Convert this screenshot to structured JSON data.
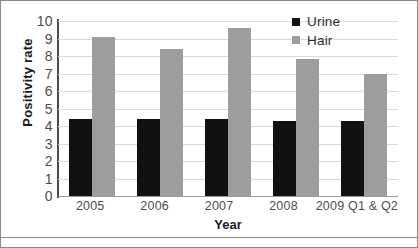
{
  "chart_data": {
    "type": "bar",
    "title": "",
    "subtitle": "",
    "xlabel": "Year",
    "ylabel": "Positivity rate",
    "categories": [
      "2005",
      "2006",
      "2007",
      "2008",
      "2009 Q1 & Q2"
    ],
    "series": [
      {
        "name": "Urine",
        "color": "#111111",
        "values": [
          4.4,
          4.4,
          4.4,
          4.3,
          4.3
        ]
      },
      {
        "name": "Hair",
        "color": "#9d9d9d",
        "values": [
          9.1,
          8.4,
          9.6,
          7.85,
          7.0
        ]
      }
    ],
    "ylim": [
      0,
      10
    ],
    "yticks": [
      "10",
      "9",
      "8",
      "7",
      "6",
      "5",
      "4",
      "3",
      "2",
      "1",
      "0"
    ],
    "ytick_values": [
      10,
      9,
      8,
      7,
      6,
      5,
      4,
      3,
      2,
      1,
      0
    ],
    "grid": true,
    "legend_position": "top-right",
    "legend": [
      "Urine",
      "Hair"
    ]
  },
  "colors": {
    "urine": "#111111",
    "hair": "#9d9d9d",
    "gridline": "#d9d9d9",
    "axis": "#4a4a4a",
    "tick_text": "#4d4d4d",
    "title_text": "#1c1c1c",
    "frame": "#8a8a8a",
    "background": "#ffffff"
  }
}
